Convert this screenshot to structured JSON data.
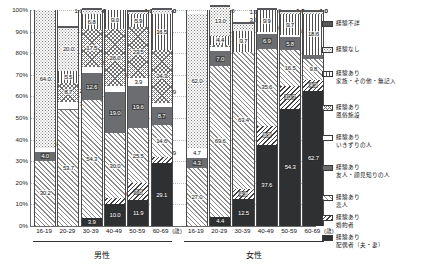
{
  "chart_data": {
    "type": "bar",
    "subtype": "stacked-100-percent",
    "title": "",
    "xlabel": "",
    "ylabel": "",
    "ylim": [
      0,
      100
    ],
    "ytick_labels": [
      "0%",
      "10%",
      "20%",
      "30%",
      "40%",
      "50%",
      "60%",
      "70%",
      "80%",
      "90%",
      "100%"
    ],
    "grid": true,
    "legend_position": "right",
    "axis_unit_note": "(歳)",
    "groups": [
      {
        "name": "男性",
        "categories": [
          "16-19",
          "20-29",
          "30-39",
          "40-49",
          "50-59",
          "60-69"
        ]
      },
      {
        "name": "女性",
        "categories": [
          "16-19",
          "20-29",
          "30-39",
          "40-49",
          "50-59",
          "60-69"
        ]
      }
    ],
    "categories": [
      "16-19",
      "20-29",
      "30-39",
      "40-49",
      "50-59",
      "60-69",
      "16-19",
      "20-29",
      "30-39",
      "40-49",
      "50-59",
      "60-69"
    ],
    "series": [
      {
        "name": "経験あり\n配偶者（夫・妻）",
        "key": "haigusha",
        "pattern": "p-haigusha",
        "values": [
          0.0,
          0.0,
          3.9,
          10.0,
          11.9,
          29.1,
          0.0,
          4.4,
          12.5,
          37.6,
          54.3,
          62.7
        ]
      },
      {
        "name": "経験あり\n婚約者",
        "key": "konyaku",
        "pattern": "p-konyaku",
        "values": [
          0.0,
          0.0,
          0.0,
          3.0,
          7.8,
          2.9,
          0.0,
          0.0,
          4.8,
          8.9,
          10.7,
          4.9
        ]
      },
      {
        "name": "経験あり\n恋人",
        "key": "koibito",
        "pattern": "p-koibito",
        "values": [
          30.2,
          53.7,
          54.3,
          30.0,
          25.5,
          14.6,
          27.0,
          69.6,
          63.4,
          35.6,
          16.5,
          9.8
        ]
      },
      {
        "name": "経験あり\n友人・顔見知りの人",
        "key": "yujin",
        "pattern": "p-yujin",
        "values": [
          4.0,
          0.7,
          12.6,
          19.0,
          19.6,
          8.7,
          4.3,
          7.0,
          0.0,
          6.9,
          5.8,
          2.0
        ]
      },
      {
        "name": "経験あり\nいきずりの人",
        "key": "ikizuri",
        "pattern": "p-ikizuri",
        "values": [
          1.8,
          3.2,
          2.9,
          3.0,
          3.9,
          1.9,
          4.7,
          1.7,
          0.0,
          1.0,
          1.0,
          0.0
        ]
      },
      {
        "name": "経験あり\n風俗施設",
        "key": "fuzoku",
        "pattern": "p-fuzoku",
        "values": [
          0.0,
          8.7,
          17.5,
          26.0,
          23.5,
          24.3,
          0.0,
          1.1,
          0.0,
          0.0,
          0.0,
          0.0
        ]
      },
      {
        "name": "経験あり\n家族・その他・無記入",
        "key": "kazoku",
        "pattern": "p-kazoku",
        "values": [
          0.0,
          5.5,
          6.8,
          9.0,
          5.9,
          16.5,
          0.0,
          4.4,
          9.7,
          9.9,
          9.7,
          18.6
        ]
      },
      {
        "name": "経験なし",
        "key": "nashi",
        "pattern": "p-nashi",
        "values": [
          64.0,
          20.0,
          2.0,
          0.0,
          1.0,
          2.0,
          62.0,
          13.0,
          3.0,
          0.0,
          1.0,
          1.0
        ]
      },
      {
        "name": "経験不詳",
        "key": "fushou",
        "pattern": "p-fushou",
        "values": [
          0.0,
          1.0,
          1.0,
          0.0,
          1.0,
          1.0,
          0.0,
          1.0,
          1.0,
          1.0,
          1.0,
          1.0
        ]
      }
    ]
  },
  "legend": {
    "items": [
      {
        "label": "経験不詳",
        "pattern": "p-fushou"
      },
      {
        "label": "経験なし",
        "pattern": "p-nashi"
      },
      {
        "label": "経験あり\n家族・その他・無記入",
        "pattern": "p-kazoku"
      },
      {
        "label": "経験あり\n風俗施設",
        "pattern": "p-fuzoku"
      },
      {
        "label": "経験あり\nいきずりの人",
        "pattern": "p-ikizuri"
      },
      {
        "label": "経験あり\n友人・顔見知りの人",
        "pattern": "p-yujin"
      },
      {
        "label": "経験あり\n恋人",
        "pattern": "p-koibito"
      },
      {
        "label": "経験あり\n婚約者",
        "pattern": "p-konyaku"
      },
      {
        "label": "経験あり\n配偶者（夫・妻）",
        "pattern": "p-haigusha"
      }
    ]
  },
  "colors": {
    "axis": "#6a6a6a",
    "grid": "#b8b8b8",
    "dark_fill": "#2e3032",
    "mid_fill": "#6b6d70",
    "text": "#111111"
  }
}
